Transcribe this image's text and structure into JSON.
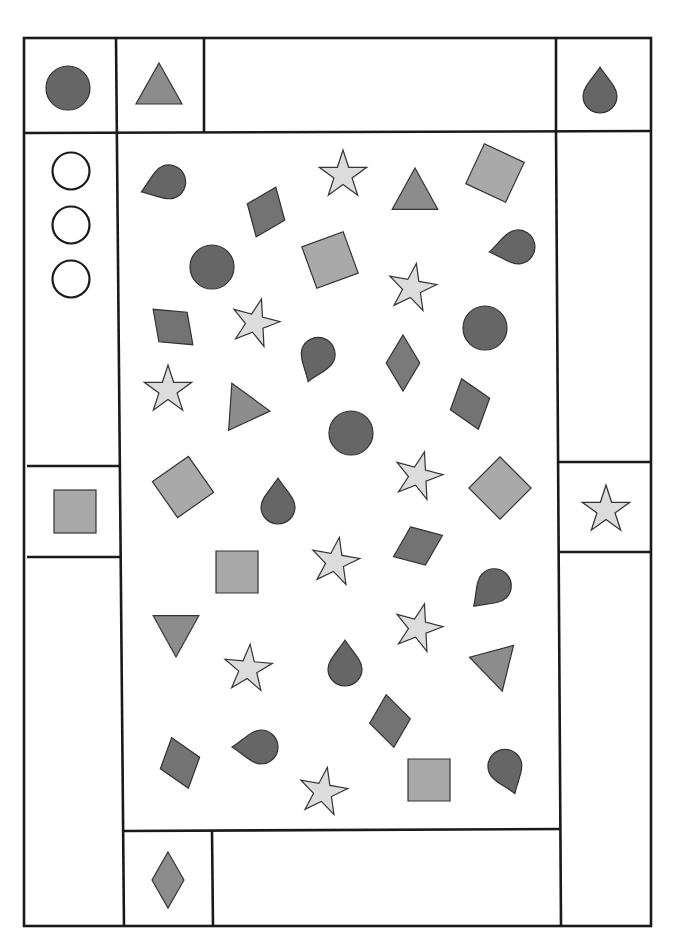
{
  "worksheet": {
    "title": "",
    "colors": {
      "line": "#1a1a1a",
      "dark_gray": "#666666",
      "medium_gray": "#8c8c8c",
      "light_gray": "#a9a9a9",
      "pale_gray": "#dcdcdc"
    },
    "reference_boxes": [
      {
        "id": "top-left",
        "shape": "circle",
        "fill": "dark_gray"
      },
      {
        "id": "top-second",
        "shape": "triangle",
        "fill": "medium_gray"
      },
      {
        "id": "top-right",
        "shape": "teardrop",
        "fill": "dark_gray"
      },
      {
        "id": "left-middle",
        "shape": "square",
        "fill": "light_gray"
      },
      {
        "id": "right-middle",
        "shape": "star",
        "fill": "pale_gray"
      },
      {
        "id": "bottom-left",
        "shape": "diamond",
        "fill": "medium_gray"
      }
    ],
    "answer_circles_count": 3,
    "scattered_shapes": [
      {
        "shape": "teardrop",
        "x": 163,
        "y": 184,
        "r": 20,
        "rot": -110
      },
      {
        "shape": "rhombus",
        "x": 266,
        "y": 212,
        "r": 22,
        "rot": -30
      },
      {
        "shape": "star",
        "x": 343,
        "y": 175,
        "r": 25,
        "rot": 0
      },
      {
        "shape": "triangle",
        "x": 415,
        "y": 192,
        "r": 24,
        "rot": 0
      },
      {
        "shape": "square",
        "x": 495,
        "y": 173,
        "r": 22,
        "rot": 25
      },
      {
        "shape": "circle",
        "x": 212,
        "y": 267,
        "r": 22,
        "rot": 0
      },
      {
        "shape": "square",
        "x": 330,
        "y": 260,
        "r": 22,
        "rot": -20
      },
      {
        "shape": "star",
        "x": 412,
        "y": 288,
        "r": 25,
        "rot": 10
      },
      {
        "shape": "teardrop",
        "x": 512,
        "y": 248,
        "r": 20,
        "rot": -100
      },
      {
        "shape": "rhombus",
        "x": 173,
        "y": 327,
        "r": 22,
        "rot": 80
      },
      {
        "shape": "star",
        "x": 255,
        "y": 323,
        "r": 25,
        "rot": 15
      },
      {
        "shape": "teardrop",
        "x": 316,
        "y": 360,
        "r": 20,
        "rot": 200
      },
      {
        "shape": "diamond",
        "x": 403,
        "y": 363,
        "r": 28,
        "rot": 0
      },
      {
        "shape": "circle",
        "x": 485,
        "y": 328,
        "r": 22,
        "rot": 0
      },
      {
        "shape": "star",
        "x": 168,
        "y": 390,
        "r": 25,
        "rot": 0
      },
      {
        "shape": "triangle",
        "x": 242,
        "y": 405,
        "r": 24,
        "rot": -25
      },
      {
        "shape": "circle",
        "x": 351,
        "y": 433,
        "r": 22,
        "rot": 0
      },
      {
        "shape": "rhombus",
        "x": 470,
        "y": 404,
        "r": 22,
        "rot": 110
      },
      {
        "shape": "square",
        "x": 183,
        "y": 487,
        "r": 22,
        "rot": -35
      },
      {
        "shape": "teardrop",
        "x": 278,
        "y": 501,
        "r": 20,
        "rot": 0
      },
      {
        "shape": "star",
        "x": 418,
        "y": 476,
        "r": 25,
        "rot": 15
      },
      {
        "shape": "square",
        "x": 500,
        "y": 488,
        "r": 22,
        "rot": 45
      },
      {
        "shape": "square",
        "x": 237,
        "y": 572,
        "r": 21,
        "rot": 0
      },
      {
        "shape": "star",
        "x": 335,
        "y": 562,
        "r": 25,
        "rot": 10
      },
      {
        "shape": "rhombus",
        "x": 418,
        "y": 546,
        "r": 22,
        "rot": 15
      },
      {
        "shape": "teardrop",
        "x": 490,
        "y": 590,
        "r": 20,
        "rot": -135
      },
      {
        "shape": "triangle",
        "x": 176,
        "y": 633,
        "r": 24,
        "rot": 180
      },
      {
        "shape": "star",
        "x": 248,
        "y": 669,
        "r": 25,
        "rot": 5
      },
      {
        "shape": "teardrop",
        "x": 345,
        "y": 663,
        "r": 20,
        "rot": 0
      },
      {
        "shape": "star",
        "x": 418,
        "y": 628,
        "r": 25,
        "rot": 15
      },
      {
        "shape": "triangle",
        "x": 496,
        "y": 668,
        "r": 24,
        "rot": 165
      },
      {
        "shape": "rhombus",
        "x": 390,
        "y": 721,
        "r": 22,
        "rot": -60
      },
      {
        "shape": "rhombus",
        "x": 180,
        "y": 763,
        "r": 22,
        "rot": -70
      },
      {
        "shape": "teardrop",
        "x": 255,
        "y": 747,
        "r": 20,
        "rot": -90
      },
      {
        "shape": "star",
        "x": 323,
        "y": 792,
        "r": 25,
        "rot": 10
      },
      {
        "shape": "square",
        "x": 429,
        "y": 780,
        "r": 21,
        "rot": 0
      },
      {
        "shape": "teardrop",
        "x": 507,
        "y": 772,
        "r": 20,
        "rot": 160
      }
    ]
  }
}
